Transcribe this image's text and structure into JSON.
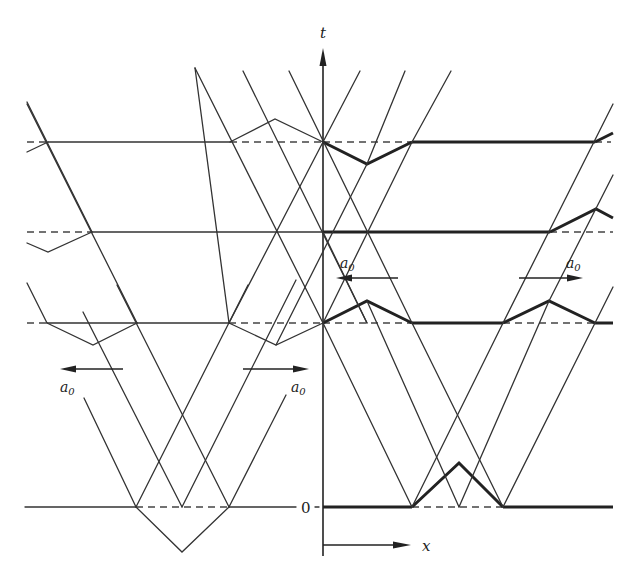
{
  "figure": {
    "title": "",
    "axes": {
      "t_label": "t",
      "x_label": "x",
      "zero_label": "0"
    },
    "annotations": [
      {
        "id": "a0-left-lower",
        "text": "a",
        "sub": "0",
        "arrow_direction": "left"
      },
      {
        "id": "a0-mid-lower",
        "text": "a",
        "sub": "0",
        "arrow_direction": "right"
      },
      {
        "id": "a0-mid-upper",
        "text": "a",
        "sub": "0",
        "arrow_direction": "left"
      },
      {
        "id": "a0-right-upper",
        "text": "a",
        "sub": "0",
        "arrow_direction": "right"
      }
    ],
    "time_levels": [
      {
        "name": "t0",
        "label": "0"
      },
      {
        "name": "t1",
        "label": ""
      },
      {
        "name": "t2",
        "label": ""
      },
      {
        "name": "t3",
        "label": ""
      }
    ]
  }
}
